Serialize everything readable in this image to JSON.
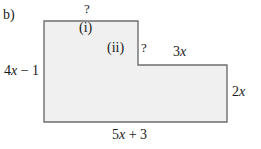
{
  "figure": {
    "part_label": "b)",
    "background_color": "#ffffff",
    "shape": {
      "name": "l-shaped-step-polygon",
      "fill_color": "#f0f0f0",
      "stroke_color": "#6e6e6e",
      "stroke_width": 1.4,
      "points": "44,21 138,21 138,65 227,65 227,122 44,122"
    },
    "region_labels": [
      {
        "id": "i",
        "text": "(i)"
      },
      {
        "id": "ii",
        "text": "(ii)"
      }
    ],
    "dimension_labels": {
      "top_unknown": "?",
      "notch_unknown": "?",
      "left_side": {
        "coefficient": "4",
        "variable": "x",
        "rest": " − 1",
        "full": "4x − 1"
      },
      "top_right_side": {
        "coefficient": "3",
        "variable": "x",
        "full": "3x"
      },
      "right_side": {
        "coefficient": "2",
        "variable": "x",
        "full": "2x"
      },
      "bottom_side": {
        "coefficient": "5",
        "variable": "x",
        "rest": " + 3",
        "full": "5x + 3"
      }
    }
  }
}
